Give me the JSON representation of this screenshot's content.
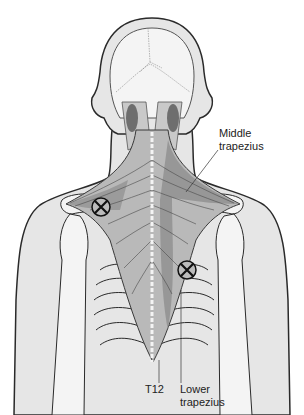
{
  "figure": {
    "labels": {
      "middle_trapezius": "Middle\ntrapezius",
      "middle_line1": "Middle",
      "middle_line2": "trapezius",
      "t12": "T12",
      "lower_line1": "Lower",
      "lower_line2": "trapezius"
    },
    "markers": [
      {
        "name": "trigger-point-middle-trapezius",
        "symbol": "circled-x",
        "x": 101,
        "y": 207
      },
      {
        "name": "trigger-point-lower-trapezius",
        "symbol": "circled-x",
        "x": 187,
        "y": 270
      }
    ],
    "colors": {
      "outline": "#2a2a2a",
      "skin": "#e6e6e6",
      "bone": "#f4f4f4",
      "muscle": "#b9b9b9",
      "muscle_dark": "#8f8f8f",
      "muscle_darkest": "#6e6e6e"
    }
  }
}
